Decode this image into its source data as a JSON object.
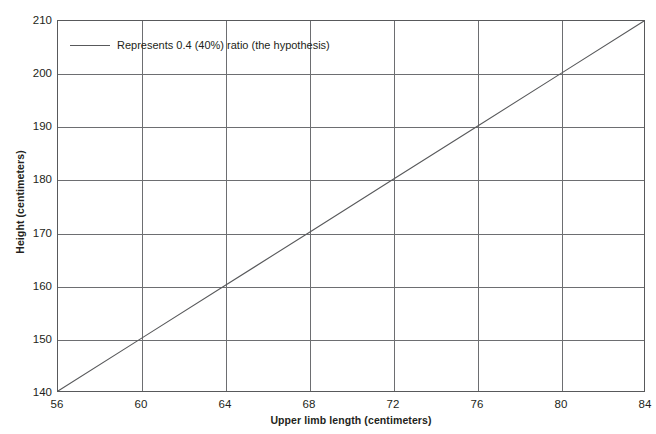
{
  "chart_data": {
    "type": "line",
    "title": "",
    "subtitle": "",
    "xlabel": "Upper limb length (centimeters)",
    "ylabel": "Height (centimeters)",
    "xlim": [
      56,
      84
    ],
    "ylim": [
      140,
      210
    ],
    "xticks": [
      56,
      60,
      64,
      68,
      72,
      76,
      80,
      84
    ],
    "yticks": [
      140,
      150,
      160,
      170,
      180,
      190,
      200,
      210
    ],
    "grid": true,
    "legend_position": "inside-top-left",
    "series": [
      {
        "name": "Represents 0.4 (40%) ratio (the hypothesis)",
        "color": "#58595b",
        "x": [
          56,
          60,
          64,
          68,
          72,
          76,
          80,
          84
        ],
        "values": [
          140,
          150,
          160,
          170,
          180,
          190,
          200,
          210
        ]
      }
    ],
    "annotations": []
  },
  "axes": {
    "x_title": "Upper limb length (centimeters)",
    "y_title": "Height (centimeters)",
    "x_tick_labels": [
      "56",
      "60",
      "64",
      "68",
      "72",
      "76",
      "80",
      "84"
    ],
    "y_tick_labels": [
      "140",
      "150",
      "160",
      "170",
      "180",
      "190",
      "200",
      "210"
    ]
  },
  "legend": {
    "entries": [
      {
        "label": "Represents 0.4 (40%) ratio (the hypothesis)",
        "color": "#58595b"
      }
    ]
  },
  "colors": {
    "line": "#58595b",
    "grid": "#6d6e71",
    "frame": "#58595b",
    "text": "#231f20",
    "background": "#ffffff"
  },
  "page": {
    "artifact": ""
  }
}
